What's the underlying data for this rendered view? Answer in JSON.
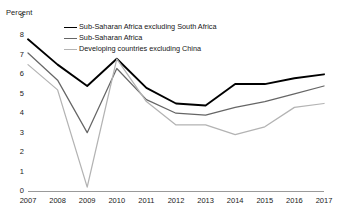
{
  "chart_data": {
    "type": "line",
    "title": "",
    "ylabel": "Percent",
    "xlabel": "",
    "ylim": [
      0,
      9
    ],
    "yticks": [
      0,
      1,
      2,
      3,
      4,
      5,
      6,
      7,
      8,
      9
    ],
    "grid": false,
    "legend_position": "top-center",
    "x": [
      2007,
      2008,
      2009,
      2010,
      2011,
      2012,
      2013,
      2014,
      2015,
      2016,
      2017
    ],
    "categories": [
      "2007",
      "2008",
      "2009",
      "2010",
      "2011",
      "2012",
      "2013",
      "2014",
      "2015",
      "2016",
      "2017"
    ],
    "series": [
      {
        "name": "Sub-Saharan Africa excluding South Africa",
        "color": "#000000",
        "values": [
          7.8,
          6.5,
          5.4,
          6.8,
          5.3,
          4.5,
          4.4,
          5.5,
          5.5,
          5.8,
          6.0
        ]
      },
      {
        "name": "Sub-Saharan Africa",
        "color": "#666666",
        "values": [
          7.1,
          5.7,
          3.0,
          6.3,
          4.7,
          4.0,
          3.9,
          4.3,
          4.6,
          5.0,
          5.4
        ]
      },
      {
        "name": "Developing countries excluding China",
        "color": "#b3b3b3",
        "values": [
          6.5,
          5.2,
          0.2,
          6.8,
          4.6,
          3.4,
          3.4,
          2.9,
          3.3,
          4.3,
          4.5
        ]
      }
    ]
  },
  "axis": {
    "y_title": "Percent",
    "y_labels": [
      "9",
      "8",
      "7",
      "6",
      "5",
      "4",
      "3",
      "2",
      "1",
      "0"
    ],
    "x_labels": [
      "2007",
      "2008",
      "2009",
      "2010",
      "2011",
      "2012",
      "2013",
      "2014",
      "2015",
      "2016",
      "2017"
    ]
  },
  "legend": {
    "items": [
      {
        "label": "Sub-Saharan Africa excluding South Africa",
        "color": "#000000"
      },
      {
        "label": "Sub-Saharan Africa",
        "color": "#666666"
      },
      {
        "label": "Developing countries excluding China",
        "color": "#b3b3b3"
      }
    ]
  }
}
